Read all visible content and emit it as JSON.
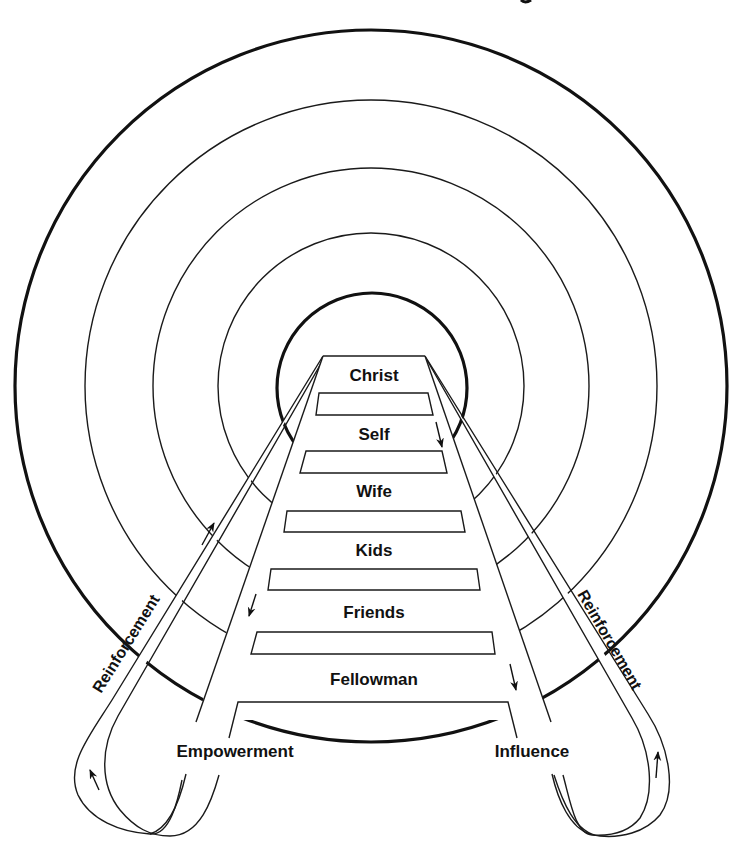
{
  "diagram": {
    "type": "concentric-circles-with-ladder",
    "colors": {
      "ink": "#111111",
      "background": "#ffffff"
    },
    "rungs": [
      {
        "label": "Christ"
      },
      {
        "label": "Self"
      },
      {
        "label": "Wife"
      },
      {
        "label": "Kids"
      },
      {
        "label": "Friends"
      },
      {
        "label": "Fellowman"
      }
    ],
    "left_side": {
      "label": "Empowerment",
      "loop_label": "Reinforcement"
    },
    "right_side": {
      "label": "Influence",
      "loop_label": "Reinforcement"
    },
    "circles_count": 5,
    "arrows": [
      "up-left-loop",
      "up-left-band",
      "down-left-rail",
      "down-self",
      "down-right-rail",
      "up-right-loop"
    ]
  }
}
